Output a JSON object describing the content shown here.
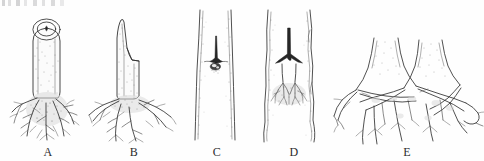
{
  "figure": {
    "background_color": "#ffffff",
    "ink_color": "#303030",
    "panel_count": 5
  },
  "panels": [
    {
      "id": "A",
      "label": "A",
      "caption": "Cutting with flat transverse cut top showing pith ring and dense fibrous basal root mass",
      "x": 6,
      "y": 8,
      "width": 84,
      "height": 130,
      "features": [
        "elliptical-cut-surface",
        "pith-ring",
        "bark-stipple",
        "basal-callus",
        "fibrous-roots"
      ]
    },
    {
      "id": "B",
      "label": "B",
      "caption": "Cutting with long sloping stepped cut and spreading coarse lateral root system",
      "x": 86,
      "y": 8,
      "width": 96,
      "height": 130,
      "features": [
        "slanted-cut",
        "step-notch",
        "bark-stipple",
        "lateral-roots",
        "fibrous-rootlets"
      ]
    },
    {
      "id": "C",
      "label": "C",
      "caption": "Stem segment in longitudinal view with small T-shaped bud wound and callus knob at centre",
      "x": 184,
      "y": 8,
      "width": 66,
      "height": 130,
      "features": [
        "stem-segment",
        "t-incision",
        "callus-knob",
        "bark-stipple"
      ]
    },
    {
      "id": "D",
      "label": "D",
      "caption": "Stem segment with inverted Y-shaped incision above an emerging adventitious root mass",
      "x": 252,
      "y": 8,
      "width": 84,
      "height": 130,
      "features": [
        "stem-segment",
        "y-incision",
        "adventitious-roots",
        "callus-pad",
        "bark-stipple"
      ]
    },
    {
      "id": "E",
      "label": "E",
      "caption": "Two adjacent trunk bases with naturally fused interconnecting root grafts",
      "x": 330,
      "y": 36,
      "width": 154,
      "height": 102,
      "features": [
        "twin-trunks",
        "root-flare",
        "root-grafts",
        "crossing-roots"
      ]
    }
  ],
  "labels": {
    "a": "A",
    "b": "B",
    "c": "C",
    "d": "D",
    "e": "E"
  }
}
